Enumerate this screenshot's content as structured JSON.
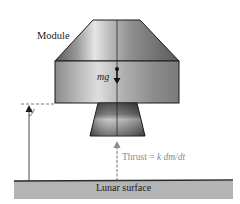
{
  "diagram": {
    "type": "physics-free-body",
    "labels": {
      "module": "Module",
      "weight": "mg",
      "height": "y",
      "thrust_prefix": "Thrust = ",
      "thrust_formula": "k dm/dt",
      "surface": "Lunar surface"
    },
    "colors": {
      "module_body_light": "#d8d8d8",
      "module_body_dark": "#6a6a6a",
      "outline": "#1a1a1a",
      "surface_fill": "#b4b4b4",
      "surface_edge": "#2a2a2a",
      "thrust_arrow": "#8c8c8c",
      "dashed_line": "#555555"
    },
    "arrows": [
      {
        "name": "weight",
        "direction": "down",
        "label": "mg"
      },
      {
        "name": "height",
        "direction": "up",
        "label": "y"
      },
      {
        "name": "thrust",
        "direction": "up",
        "label": "Thrust = k dm/dt"
      }
    ]
  }
}
